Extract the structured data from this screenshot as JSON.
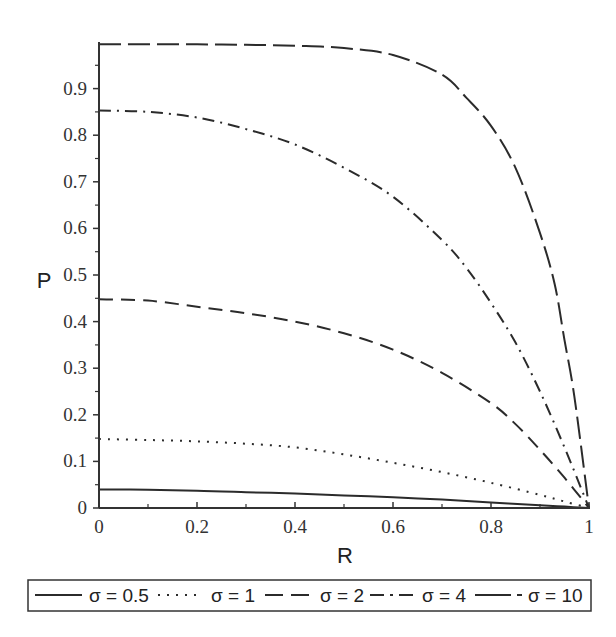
{
  "chart_data": {
    "type": "line",
    "title": "",
    "xlabel": "R",
    "ylabel": "P",
    "xlim": [
      0,
      1
    ],
    "ylim": [
      0,
      1
    ],
    "grid": false,
    "legend_position": "bottom",
    "x_ticks": [
      "0",
      "0.2",
      "0.4",
      "0.6",
      "0.8",
      "1"
    ],
    "y_ticks": [
      "0",
      "0.1",
      "0.2",
      "0.3",
      "0.4",
      "0.5",
      "0.6",
      "0.7",
      "0.8",
      "0.9"
    ],
    "series": [
      {
        "name": "σ = 0.5",
        "style": "solid",
        "dash": "",
        "x": [
          0,
          0.1,
          0.2,
          0.3,
          0.4,
          0.5,
          0.6,
          0.7,
          0.8,
          0.9,
          0.95,
          1.0
        ],
        "values": [
          0.04,
          0.039,
          0.037,
          0.034,
          0.031,
          0.027,
          0.023,
          0.018,
          0.012,
          0.006,
          0.003,
          0.0
        ]
      },
      {
        "name": "σ = 1",
        "style": "dotted",
        "dash": "2 7",
        "x": [
          0,
          0.1,
          0.2,
          0.3,
          0.4,
          0.5,
          0.6,
          0.7,
          0.8,
          0.9,
          0.95,
          1.0
        ],
        "values": [
          0.148,
          0.146,
          0.143,
          0.138,
          0.13,
          0.115,
          0.097,
          0.077,
          0.054,
          0.028,
          0.014,
          0.0
        ]
      },
      {
        "name": "σ = 2",
        "style": "dashed",
        "dash": "14 8",
        "x": [
          0,
          0.1,
          0.2,
          0.3,
          0.4,
          0.5,
          0.6,
          0.7,
          0.8,
          0.85,
          0.9,
          0.95,
          1.0
        ],
        "values": [
          0.448,
          0.445,
          0.432,
          0.418,
          0.4,
          0.375,
          0.34,
          0.29,
          0.225,
          0.18,
          0.125,
          0.065,
          0.0
        ]
      },
      {
        "name": "σ = 4",
        "style": "dash-dot",
        "dash": "12 6 2 6",
        "x": [
          0,
          0.1,
          0.2,
          0.3,
          0.4,
          0.5,
          0.6,
          0.7,
          0.75,
          0.8,
          0.85,
          0.9,
          0.95,
          1.0
        ],
        "values": [
          0.853,
          0.85,
          0.838,
          0.813,
          0.78,
          0.73,
          0.668,
          0.575,
          0.515,
          0.44,
          0.355,
          0.25,
          0.13,
          0.0
        ]
      },
      {
        "name": "σ = 10",
        "style": "long-dash-dot",
        "dash": "22 7",
        "x": [
          0,
          0.1,
          0.2,
          0.3,
          0.4,
          0.5,
          0.6,
          0.7,
          0.75,
          0.8,
          0.85,
          0.9,
          0.93,
          0.95,
          0.97,
          1.0
        ],
        "values": [
          0.995,
          0.995,
          0.995,
          0.994,
          0.992,
          0.987,
          0.972,
          0.93,
          0.88,
          0.82,
          0.73,
          0.59,
          0.48,
          0.36,
          0.24,
          0.0
        ]
      }
    ]
  },
  "axes": {
    "x_title": "R",
    "y_title": "P"
  },
  "legend": {
    "items": [
      {
        "label": "σ = 0.5"
      },
      {
        "label": "σ = 1"
      },
      {
        "label": "σ = 2"
      },
      {
        "label": "σ = 4"
      },
      {
        "label": "σ = 10"
      }
    ]
  }
}
